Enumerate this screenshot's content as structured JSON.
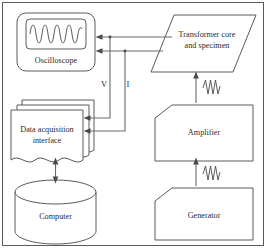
{
  "figure": {
    "type": "block-diagram",
    "background_color": "#ffffff",
    "line_color": "#5a5a5a",
    "text_color": "#2a2a2a"
  },
  "blocks": {
    "oscilloscope": {
      "label": "Oscilloscope",
      "shape": "rounded-rectangle-with-screen",
      "screen_content": "sine-waveform"
    },
    "transformer": {
      "label_line1": "Transformer core",
      "label_line2": "and specimen",
      "shape": "parallelogram"
    },
    "daq": {
      "label_line1": "Data acquisition",
      "label_line2": "interface",
      "shape": "stacked-documents"
    },
    "amplifier": {
      "label": "Amplifier",
      "shape": "clipped-corner-rectangle"
    },
    "computer": {
      "label": "Computer",
      "shape": "cylinder"
    },
    "generator": {
      "label": "Generator",
      "shape": "clipped-corner-rectangle"
    }
  },
  "signals": {
    "voltage": {
      "label": "V"
    },
    "current": {
      "label": "I"
    }
  },
  "connections": [
    {
      "name": "transformer-to-oscilloscope-voltage",
      "from": "transformer",
      "to": "oscilloscope",
      "arrow": "single"
    },
    {
      "name": "transformer-to-oscilloscope-current",
      "from": "transformer",
      "to": "oscilloscope",
      "arrow": "single"
    },
    {
      "name": "voltage-to-daq",
      "from": "transformer",
      "to": "daq",
      "arrow": "single",
      "label": "V"
    },
    {
      "name": "current-to-daq",
      "from": "transformer",
      "to": "daq",
      "arrow": "single",
      "label": "I"
    },
    {
      "name": "daq-to-computer",
      "from": "daq",
      "to": "computer",
      "arrow": "double"
    },
    {
      "name": "amplifier-to-transformer",
      "from": "amplifier",
      "to": "transformer",
      "arrow": "single",
      "marker": "ac-waveform"
    },
    {
      "name": "generator-to-amplifier",
      "from": "generator",
      "to": "amplifier",
      "arrow": "single",
      "marker": "ac-waveform"
    }
  ]
}
